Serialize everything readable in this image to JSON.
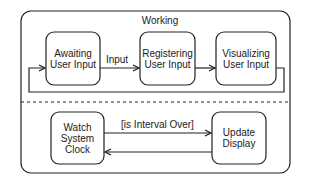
{
  "diagram": {
    "type": "UML state machine",
    "composite_state": {
      "title": "Working"
    },
    "top_region": {
      "states": [
        {
          "id": "awaiting",
          "line1": "Awaiting",
          "line2": "User Input"
        },
        {
          "id": "registering",
          "line1": "Registering",
          "line2": "User Input"
        },
        {
          "id": "visualizing",
          "line1": "Visualizing",
          "line2": "User Input"
        }
      ],
      "transitions": [
        {
          "from": "awaiting",
          "to": "registering",
          "label": "Input"
        },
        {
          "from": "registering",
          "to": "visualizing",
          "label": ""
        },
        {
          "from": "visualizing",
          "to": "awaiting",
          "label": ""
        }
      ]
    },
    "bottom_region": {
      "states": [
        {
          "id": "watch",
          "line1": "Watch",
          "line2": "System",
          "line3": "Clock"
        },
        {
          "id": "update",
          "line1": "Update",
          "line2": "Display"
        }
      ],
      "transitions": [
        {
          "from": "watch",
          "to": "update",
          "label": "[is Interval Over]"
        },
        {
          "from": "update",
          "to": "watch",
          "label": ""
        }
      ]
    },
    "colors": {
      "stroke": "#222222",
      "background": "#ffffff"
    }
  }
}
